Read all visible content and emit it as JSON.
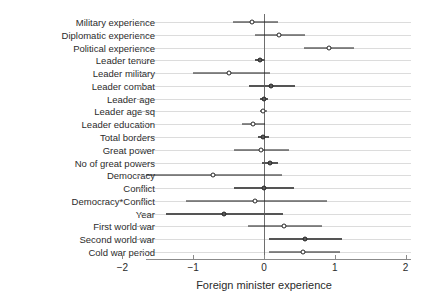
{
  "chart_data": {
    "type": "scatter",
    "title": "",
    "subtitle": "",
    "xlabel": "Foreign minister experience",
    "ylabel": "",
    "xlim": [
      -2.35,
      2.25
    ],
    "xticks": [
      -2,
      -1,
      0,
      1,
      2
    ],
    "xticklabels": [
      "−2",
      "−1",
      "0",
      "1",
      "2"
    ],
    "grid": true,
    "legend": "none",
    "reference_line": 0,
    "note": "Coefficient plot with point estimates and confidence intervals",
    "categories": [
      "Military experience",
      "Diplomatic experience",
      "Political experience",
      "Leader tenure",
      "Leader military",
      "Leader combat",
      "Leader age",
      "Leader age sq",
      "Leader education",
      "Total borders",
      "Great power",
      "No of great powers",
      "Democracy",
      "Conflict",
      "Democracy*Conflict",
      "Year",
      "First world war",
      "Second world war",
      "Cold war period"
    ],
    "estimates": [
      -0.17,
      0.21,
      0.92,
      -0.06,
      -0.49,
      0.1,
      0.0,
      -0.01,
      -0.15,
      -0.01,
      -0.04,
      0.08,
      -0.72,
      0.0,
      -0.13,
      -0.56,
      0.28,
      0.58,
      0.55
    ],
    "ci_low": [
      -0.44,
      -0.13,
      0.56,
      -0.13,
      -1.0,
      -0.21,
      -0.06,
      -0.06,
      -0.31,
      -0.08,
      -0.42,
      -0.03,
      -1.66,
      -0.42,
      -1.1,
      -1.38,
      -0.23,
      0.07,
      0.07
    ],
    "ci_high": [
      0.2,
      0.58,
      1.27,
      0.01,
      0.08,
      0.44,
      0.06,
      0.04,
      0.01,
      0.07,
      0.35,
      0.2,
      0.25,
      0.42,
      0.89,
      0.27,
      0.82,
      1.1,
      1.07
    ],
    "marker_filled": [
      false,
      false,
      false,
      true,
      false,
      true,
      true,
      false,
      false,
      true,
      false,
      true,
      false,
      true,
      false,
      true,
      false,
      true,
      false
    ]
  }
}
